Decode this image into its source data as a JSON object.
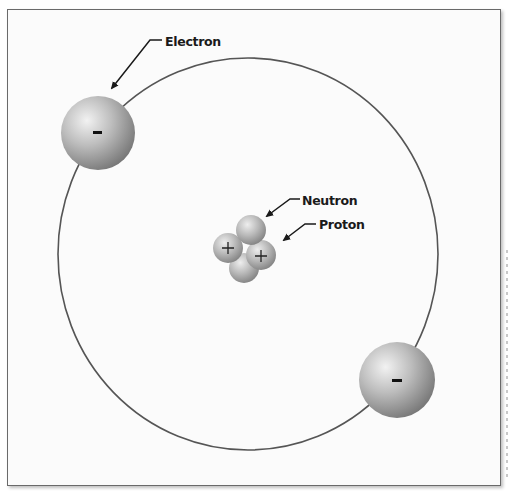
{
  "diagram": {
    "type": "atom-model",
    "labels": {
      "electron": "Electron",
      "neutron": "Neutron",
      "proton": "Proton"
    },
    "symbols": {
      "electron_charge": "-",
      "proton_charge": "+"
    },
    "colors": {
      "background": "#fbfbfb",
      "frame": "#6a6a6a",
      "orbit": "#555555",
      "sphere_light": "#ececec",
      "sphere_mid": "#b4b4b4",
      "sphere_dark": "#7a7a7a",
      "label_text": "#1a1a1a"
    },
    "orbit": {
      "cx": 248,
      "cy": 254,
      "rx": 190,
      "ry": 196
    },
    "electrons": [
      {
        "cx": 98,
        "cy": 133,
        "r": 37,
        "charge": "-"
      },
      {
        "cx": 397,
        "cy": 380,
        "r": 38,
        "charge": "-"
      }
    ],
    "nucleus": [
      {
        "kind": "neutron",
        "cx": 244,
        "cy": 268,
        "r": 15
      },
      {
        "kind": "proton",
        "cx": 228,
        "cy": 248,
        "r": 15,
        "charge": "+"
      },
      {
        "kind": "proton",
        "cx": 261,
        "cy": 255,
        "r": 15,
        "charge": "+"
      },
      {
        "kind": "neutron",
        "cx": 251,
        "cy": 230,
        "r": 15
      }
    ]
  }
}
